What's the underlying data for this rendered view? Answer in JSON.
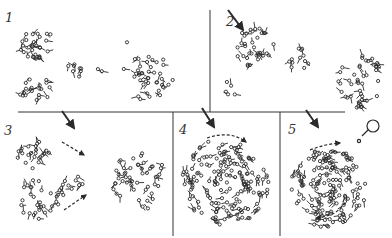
{
  "figure": {
    "colors": {
      "ink": "#2a2a2a",
      "background": "#ffffff"
    },
    "panels": [
      {
        "label": "1",
        "x": 5,
        "y": 12
      },
      {
        "label": "2",
        "x": 228,
        "y": 22
      },
      {
        "label": "3",
        "x": 4,
        "y": 133
      },
      {
        "label": "4",
        "x": 180,
        "y": 130
      },
      {
        "label": "5",
        "x": 288,
        "y": 130
      }
    ]
  }
}
